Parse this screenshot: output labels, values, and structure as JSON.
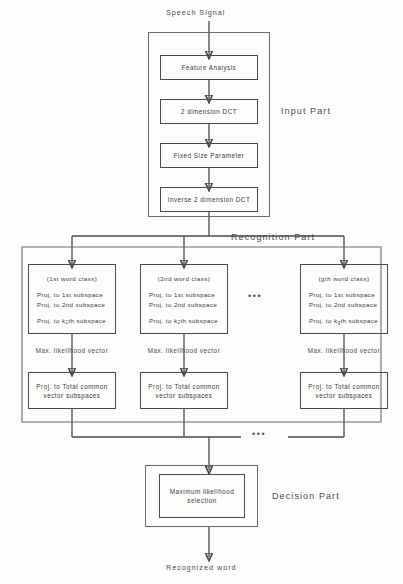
{
  "diagram": {
    "top_label": "Speech Signal",
    "bottom_label": "Recognized word",
    "sections": {
      "input": "Input Part",
      "recognition": "Recognition Part",
      "decision": "Decision Part"
    },
    "input_blocks": [
      {
        "label": "Feature Analysis"
      },
      {
        "label": "2 dimension DCT"
      },
      {
        "label": "Fixed Size Parameter"
      },
      {
        "label": "Inverse 2 dimension DCT"
      }
    ],
    "word_classes": [
      {
        "title": "(1st word class)",
        "lines": [
          "Proj.  to  1st subspace",
          "Proj.  to 2nd subspace"
        ],
        "last_line_prefix": "Proj.  to  k",
        "last_line_sub": "1",
        "last_line_suffix": "th subspace",
        "vector_label": "Max. likelihood vector",
        "common_label_line1": "Proj. to Total common",
        "common_label_line2": "vector subspaces"
      },
      {
        "title": "(2nd word class)",
        "lines": [
          "Proj.  to  1st subspace",
          "Proj.  to 2nd subspace"
        ],
        "last_line_prefix": "Proj.  to  k",
        "last_line_sub": "2",
        "last_line_suffix": "th subspace",
        "vector_label": "Max. likelihood vector",
        "common_label_line1": "Proj. to Total common",
        "common_label_line2": "vector subspaces"
      },
      {
        "title": "(gth word class)",
        "lines": [
          "Proj.  to  1st subspace",
          "Proj.  to 2nd subspace"
        ],
        "last_line_prefix": "Proj.  to  k",
        "last_line_sub": "g",
        "last_line_suffix": "th subspace",
        "vector_label": "Max. likelihood vector",
        "common_label_line1": "Proj. to Total common",
        "common_label_line2": "vector subspaces"
      }
    ],
    "ellipsis_mark": "•••",
    "decision_block": {
      "line1": "Maximum likelihood",
      "line2": "selection"
    },
    "colors": {
      "stroke": "#4a4a4a",
      "outer_stroke": "#6a6a6a",
      "text": "#3a3a3a",
      "background": "#fdfdfc"
    }
  }
}
